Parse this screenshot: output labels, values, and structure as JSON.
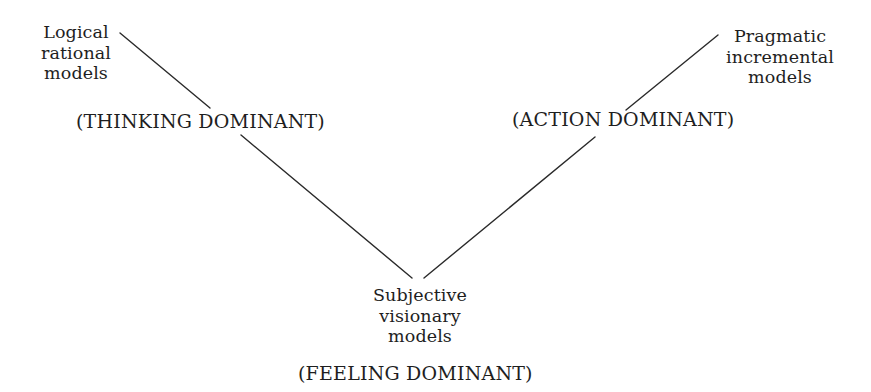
{
  "diagram": {
    "type": "v-shaped model map",
    "nodes": [
      {
        "id": "logical",
        "lines": [
          "Logical",
          "rational",
          "models"
        ],
        "dominance": "(THINKING DOMINANT)",
        "position": "top-left"
      },
      {
        "id": "pragmatic",
        "lines": [
          "Pragmatic",
          "incremental",
          "models"
        ],
        "dominance": "(ACTION DOMINANT)",
        "position": "top-right"
      },
      {
        "id": "subjective",
        "lines": [
          "Subjective",
          "visionary",
          "models"
        ],
        "dominance": "(FEELING DOMINANT)",
        "position": "bottom-center"
      }
    ],
    "edges": [
      {
        "from": "logical",
        "to": "subjective",
        "via_label": "(THINKING DOMINANT)"
      },
      {
        "from": "pragmatic",
        "to": "subjective",
        "via_label": "(ACTION DOMINANT)"
      }
    ],
    "colors": {
      "background": "#ffffff",
      "text": "#1e1e1e",
      "line": "#2a2a2a"
    }
  }
}
